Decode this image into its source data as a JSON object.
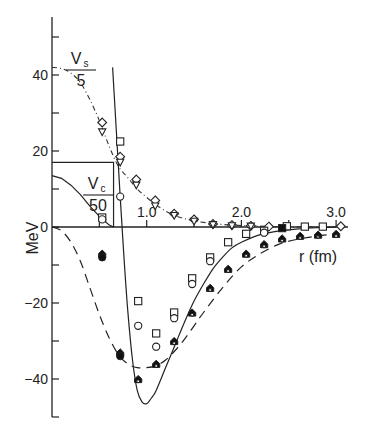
{
  "chart_data": {
    "type": "line",
    "title": "",
    "xlabel": "r (fm)",
    "ylabel": "MeV",
    "xlim": [
      0,
      3.1
    ],
    "ylim": [
      -50,
      55
    ],
    "grid": false,
    "x_ticks": [
      0,
      0.5,
      1.0,
      1.5,
      2.0,
      2.5,
      3.0
    ],
    "x_tick_labels": [
      "",
      "",
      "1.0",
      "",
      "2.0",
      "",
      "3.0"
    ],
    "y_ticks": [
      -50,
      -40,
      -30,
      -20,
      -10,
      0,
      10,
      20,
      30,
      40,
      50
    ],
    "y_tick_labels": [
      "",
      "-40",
      "",
      "-20",
      "",
      "0",
      "",
      "20",
      "",
      "40",
      ""
    ],
    "annotations": [
      {
        "text": "V_s / 5",
        "numerator": "V",
        "subscript": "s",
        "denominator": "5",
        "x": 0.3,
        "y": 44
      },
      {
        "text": "V_c / 50",
        "numerator": "V",
        "subscript": "c",
        "denominator": "50",
        "x": 0.55,
        "y": 11
      }
    ],
    "series": [
      {
        "name": "Vs/5 (dash-dot)",
        "style": "dashdot",
        "x": [
          0.0,
          0.1,
          0.2,
          0.3,
          0.4,
          0.5,
          0.6,
          0.7,
          0.8,
          0.9,
          1.0,
          1.1,
          1.2,
          1.3,
          1.4,
          1.5,
          1.7,
          1.9,
          2.1,
          2.4,
          2.7,
          3.0
        ],
        "y": [
          42,
          41.7,
          40.5,
          38,
          33.5,
          28,
          21.5,
          16,
          13,
          10,
          7.8,
          5.8,
          4.2,
          3,
          2.2,
          1.6,
          0.9,
          0.5,
          0.3,
          0.1,
          0.05,
          0
        ]
      },
      {
        "name": "Vc/50 (solid, inside box)",
        "style": "solid",
        "x": [
          0.0,
          0.1,
          0.2,
          0.3,
          0.4,
          0.5,
          0.6,
          0.65
        ],
        "y": [
          13.5,
          12.8,
          11,
          8.5,
          5.5,
          2.8,
          0.6,
          0
        ]
      },
      {
        "name": "Vc/50 box",
        "style": "solid",
        "x": [
          0.0,
          0.65,
          0.65
        ],
        "y": [
          17,
          17,
          0
        ]
      },
      {
        "name": "Total potential (solid)",
        "style": "solid",
        "x": [
          0.64,
          0.68,
          0.72,
          0.76,
          0.8,
          0.85,
          0.9,
          0.95,
          1.0,
          1.05,
          1.1,
          1.2,
          1.3,
          1.4,
          1.5,
          1.6,
          1.7,
          1.8,
          1.9,
          2.0,
          2.2,
          2.4,
          2.6,
          2.8,
          3.0
        ],
        "y": [
          42,
          25,
          8,
          -8,
          -22,
          -35,
          -43,
          -46,
          -46.5,
          -45,
          -43,
          -37,
          -31,
          -25,
          -19.5,
          -15,
          -11,
          -8,
          -5.5,
          -4,
          -2,
          -1,
          -0.5,
          -0.2,
          0
        ]
      },
      {
        "name": "Dashed potential",
        "style": "dashed",
        "x": [
          0.0,
          0.1,
          0.2,
          0.3,
          0.4,
          0.5,
          0.6,
          0.7,
          0.8,
          0.9,
          1.0,
          1.1,
          1.2,
          1.3,
          1.4,
          1.5,
          1.6,
          1.8,
          2.0,
          2.2,
          2.4,
          2.6,
          2.8,
          3.0
        ],
        "y": [
          0,
          -1,
          -4,
          -9,
          -16,
          -23,
          -29,
          -33.5,
          -36,
          -37,
          -37,
          -36.5,
          -35,
          -32.5,
          -29.5,
          -26,
          -22.5,
          -16,
          -10.5,
          -7,
          -4.5,
          -3.2,
          -2.4,
          -1.8
        ]
      }
    ],
    "markers": [
      {
        "shape": "diamond",
        "x": 0.53,
        "y": 27.5
      },
      {
        "shape": "triangle-down",
        "x": 0.53,
        "y": 25
      },
      {
        "shape": "square",
        "x": 0.72,
        "y": 22.5
      },
      {
        "shape": "diamond",
        "x": 0.72,
        "y": 18.5
      },
      {
        "shape": "triangle-down",
        "x": 0.72,
        "y": 17
      },
      {
        "shape": "circle",
        "x": 0.72,
        "y": 8
      },
      {
        "shape": "diamond",
        "x": 0.89,
        "y": 12.5
      },
      {
        "shape": "triangle-down",
        "x": 0.89,
        "y": 11
      },
      {
        "shape": "diamond",
        "x": 1.09,
        "y": 7
      },
      {
        "shape": "triangle-down",
        "x": 1.09,
        "y": 5.5
      },
      {
        "shape": "diamond",
        "x": 1.29,
        "y": 3.5
      },
      {
        "shape": "triangle-down",
        "x": 1.29,
        "y": 3
      },
      {
        "shape": "diamond",
        "x": 1.5,
        "y": 2
      },
      {
        "shape": "triangle-down",
        "x": 1.5,
        "y": 1.5
      },
      {
        "shape": "diamond",
        "x": 1.7,
        "y": 0.8
      },
      {
        "shape": "triangle-down",
        "x": 1.7,
        "y": 0.6
      },
      {
        "shape": "diamond",
        "x": 1.9,
        "y": 0.5
      },
      {
        "shape": "triangle-down",
        "x": 1.9,
        "y": 0.3
      },
      {
        "shape": "diamond",
        "x": 2.1,
        "y": 0.3
      },
      {
        "shape": "triangle-down",
        "x": 2.1,
        "y": 0.2
      },
      {
        "shape": "diamond",
        "x": 2.29,
        "y": 0.1
      },
      {
        "shape": "square",
        "x": 2.48,
        "y": 0.2
      },
      {
        "shape": "square",
        "x": 2.67,
        "y": 0.1
      },
      {
        "shape": "square",
        "x": 2.86,
        "y": 0.1
      },
      {
        "shape": "diamond",
        "x": 3.05,
        "y": 0.2
      },
      {
        "shape": "square",
        "x": 0.53,
        "y": 2.5
      },
      {
        "shape": "circle",
        "x": 0.53,
        "y": 2
      },
      {
        "shape": "filled-triangle",
        "x": 0.53,
        "y": -7
      },
      {
        "shape": "filled-circle",
        "x": 0.53,
        "y": -8
      },
      {
        "shape": "filled-triangle",
        "x": 0.72,
        "y": -33
      },
      {
        "shape": "filled-circle",
        "x": 0.72,
        "y": -34
      },
      {
        "shape": "square",
        "x": 0.91,
        "y": -19.5
      },
      {
        "shape": "circle",
        "x": 0.91,
        "y": -26
      },
      {
        "shape": "filled-triangle",
        "x": 0.91,
        "y": -40
      },
      {
        "shape": "square",
        "x": 1.1,
        "y": -28
      },
      {
        "shape": "circle",
        "x": 1.1,
        "y": -31.5
      },
      {
        "shape": "filled-triangle",
        "x": 1.1,
        "y": -36
      },
      {
        "shape": "square",
        "x": 1.29,
        "y": -22.5
      },
      {
        "shape": "circle",
        "x": 1.29,
        "y": -24
      },
      {
        "shape": "filled-triangle",
        "x": 1.29,
        "y": -30
      },
      {
        "shape": "square",
        "x": 1.48,
        "y": -13.5
      },
      {
        "shape": "circle",
        "x": 1.48,
        "y": -15
      },
      {
        "shape": "filled-triangle",
        "x": 1.48,
        "y": -22.5
      },
      {
        "shape": "square",
        "x": 1.67,
        "y": -8
      },
      {
        "shape": "circle",
        "x": 1.67,
        "y": -9
      },
      {
        "shape": "filled-triangle",
        "x": 1.67,
        "y": -16
      },
      {
        "shape": "square",
        "x": 1.86,
        "y": -4
      },
      {
        "shape": "filled-triangle",
        "x": 1.86,
        "y": -11
      },
      {
        "shape": "square",
        "x": 2.05,
        "y": -1.8
      },
      {
        "shape": "filled-triangle",
        "x": 2.05,
        "y": -7
      },
      {
        "shape": "square",
        "x": 2.24,
        "y": -1
      },
      {
        "shape": "circle",
        "x": 2.24,
        "y": -1.5
      },
      {
        "shape": "filled-triangle",
        "x": 2.24,
        "y": -4.5
      },
      {
        "shape": "filled-square",
        "x": 2.43,
        "y": -0.3
      },
      {
        "shape": "filled-triangle",
        "x": 2.43,
        "y": -3
      },
      {
        "shape": "filled-triangle",
        "x": 2.62,
        "y": -2.3
      },
      {
        "shape": "filled-triangle",
        "x": 2.81,
        "y": -2
      },
      {
        "shape": "filled-triangle",
        "x": 3.0,
        "y": -1.8
      }
    ]
  }
}
